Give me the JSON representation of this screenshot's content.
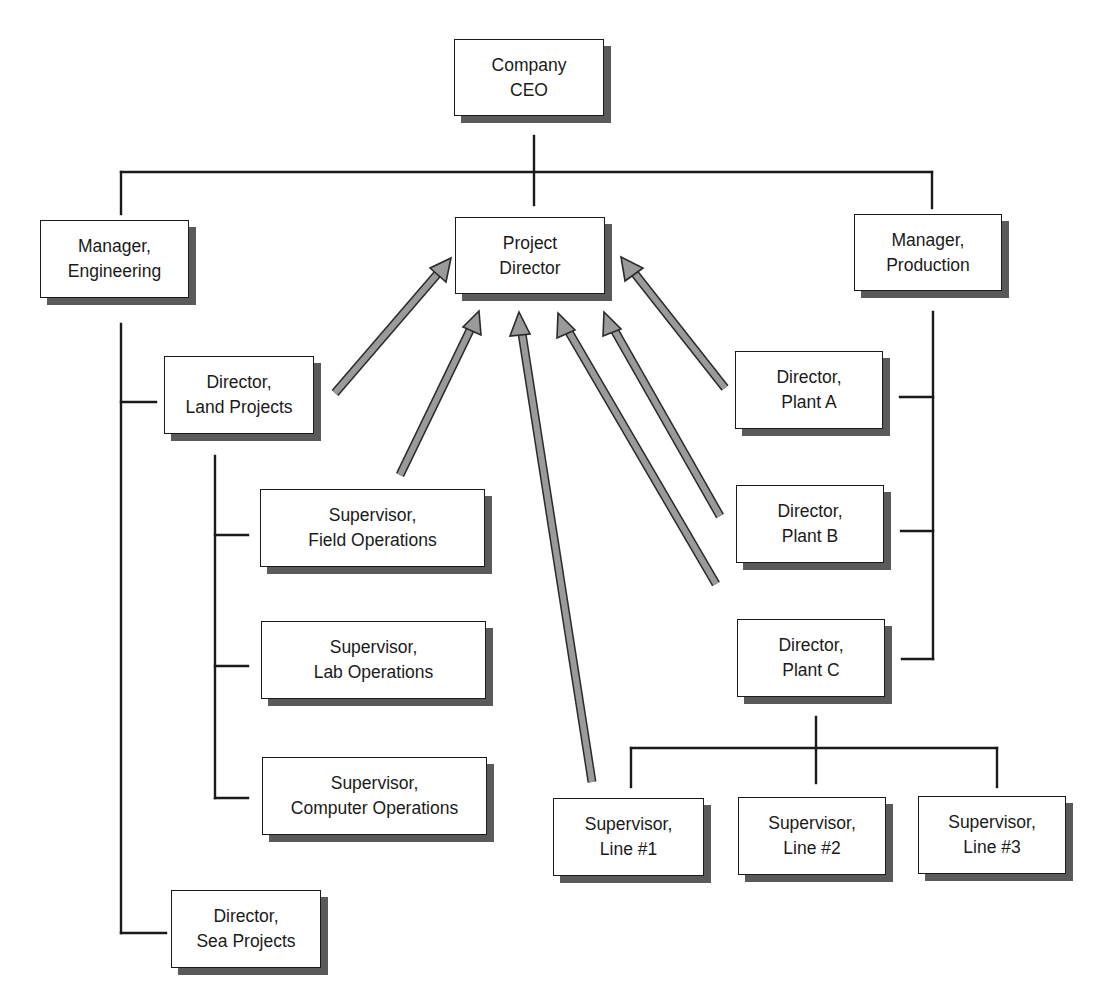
{
  "colors": {
    "line": "#1a1a1a",
    "shadow": "#5a5a5a",
    "arrow_fill": "#9a9a9a",
    "arrow_stroke": "#2a2a2a",
    "box_fill": "#ffffff"
  },
  "nodes": {
    "ceo": {
      "line1": "Company",
      "line2": "CEO"
    },
    "mgr_eng": {
      "line1": "Manager,",
      "line2": "Engineering"
    },
    "project_director": {
      "line1": "Project",
      "line2": "Director"
    },
    "mgr_prod": {
      "line1": "Manager,",
      "line2": "Production"
    },
    "dir_land": {
      "line1": "Director,",
      "line2": "Land Projects"
    },
    "sup_field": {
      "line1": "Supervisor,",
      "line2": "Field Operations"
    },
    "sup_lab": {
      "line1": "Supervisor,",
      "line2": "Lab Operations"
    },
    "sup_computer": {
      "line1": "Supervisor,",
      "line2": "Computer Operations"
    },
    "dir_sea": {
      "line1": "Director,",
      "line2": "Sea Projects"
    },
    "dir_plant_a": {
      "line1": "Director,",
      "line2": "Plant A"
    },
    "dir_plant_b": {
      "line1": "Director,",
      "line2": "Plant B"
    },
    "dir_plant_c": {
      "line1": "Director,",
      "line2": "Plant C"
    },
    "sup_line1": {
      "line1": "Supervisor,",
      "line2": "Line #1"
    },
    "sup_line2": {
      "line1": "Supervisor,",
      "line2": "Line #2"
    },
    "sup_line3": {
      "line1": "Supervisor,",
      "line2": "Line #3"
    }
  },
  "hierarchy": [
    {
      "parent": "Company CEO",
      "children": [
        "Manager, Engineering",
        "Project Director",
        "Manager, Production"
      ]
    },
    {
      "parent": "Manager, Engineering",
      "children": [
        "Director, Land Projects",
        "Director, Sea Projects"
      ]
    },
    {
      "parent": "Director, Land Projects",
      "children": [
        "Supervisor, Field Operations",
        "Supervisor, Lab Operations",
        "Supervisor, Computer Operations"
      ]
    },
    {
      "parent": "Manager, Production",
      "children": [
        "Director, Plant A",
        "Director, Plant B",
        "Director, Plant C"
      ]
    },
    {
      "parent": "Director, Plant C",
      "children": [
        "Supervisor, Line #1",
        "Supervisor, Line #2",
        "Supervisor, Line #3"
      ]
    }
  ],
  "arrows_to_project_director": [
    "Director, Land Projects",
    "Supervisor, Field Operations",
    "Supervisor, Line #1",
    "Director, Plant C",
    "Director, Plant B",
    "Director, Plant A"
  ]
}
